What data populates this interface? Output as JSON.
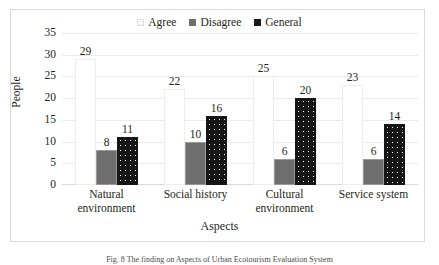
{
  "chart_data": {
    "type": "bar",
    "title": "",
    "categories": [
      "Natural environment",
      "Social history",
      "Cultural environment",
      "Service system"
    ],
    "series": [
      {
        "name": "Agree",
        "values": [
          29,
          22,
          25,
          23
        ],
        "style": "white-dotted",
        "color": "#ffffff"
      },
      {
        "name": "Disagree",
        "values": [
          8,
          10,
          6,
          6
        ],
        "style": "solid-gray",
        "color": "#6e6e6e"
      },
      {
        "name": "General",
        "values": [
          11,
          16,
          20,
          14
        ],
        "style": "black-dotted",
        "color": "#161616"
      }
    ],
    "xlabel": "Aspects",
    "ylabel": "People",
    "ylim": [
      0,
      35
    ],
    "yticks": [
      35,
      30,
      25,
      20,
      15,
      10,
      5,
      0
    ],
    "grid": true,
    "legend_position": "top-center"
  },
  "legend": {
    "entries": [
      {
        "label": "Agree"
      },
      {
        "label": "Disagree"
      },
      {
        "label": "General"
      }
    ]
  },
  "axes": {
    "y_title": "People",
    "x_title": "Aspects"
  },
  "caption": {
    "text": "Fig. 8  The finding on Aspects of Urban Ecotourism Evaluation System"
  }
}
